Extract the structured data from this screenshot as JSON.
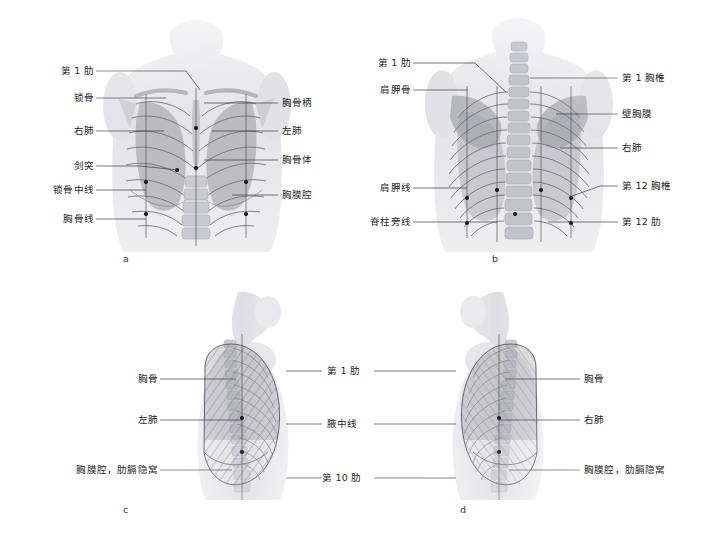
{
  "figure": {
    "background_color": "#ffffff",
    "line_color": "#3d3d3d",
    "text_color": "#1f1f1f"
  },
  "panels": [
    {
      "id": "a",
      "letter": "a",
      "view": "anterior-view",
      "labels_left": [
        {
          "text": "第 1 肋",
          "name": "label-first-rib"
        },
        {
          "text": "锁骨",
          "name": "label-clavicle"
        },
        {
          "text": "右肺",
          "name": "label-right-lung"
        },
        {
          "text": "剑突",
          "name": "label-xiphoid-process"
        },
        {
          "text": "锁骨中线",
          "name": "label-midclavicular-line"
        },
        {
          "text": "胸骨线",
          "name": "label-sternal-line"
        }
      ],
      "labels_right": [
        {
          "text": "胸骨柄",
          "name": "label-manubrium"
        },
        {
          "text": "左肺",
          "name": "label-left-lung"
        },
        {
          "text": "胸骨体",
          "name": "label-sternal-body"
        },
        {
          "text": "胸膜腔",
          "name": "label-pleural-cavity"
        }
      ]
    },
    {
      "id": "b",
      "letter": "b",
      "view": "posterior-view",
      "labels_left": [
        {
          "text": "第 1 肋",
          "name": "label-first-rib"
        },
        {
          "text": "肩胛骨",
          "name": "label-scapula"
        },
        {
          "text": "肩胛线",
          "name": "label-scapular-line"
        },
        {
          "text": "脊柱旁线",
          "name": "label-paravertebral-line"
        }
      ],
      "labels_right": [
        {
          "text": "第 1 胸椎",
          "name": "label-first-thoracic-vertebra"
        },
        {
          "text": "壁胸膜",
          "name": "label-parietal-pleura"
        },
        {
          "text": "右肺",
          "name": "label-right-lung"
        },
        {
          "text": "第 12 胸椎",
          "name": "label-twelfth-thoracic-vertebra"
        },
        {
          "text": "第 12 肋",
          "name": "label-twelfth-rib"
        }
      ]
    },
    {
      "id": "c",
      "letter": "c",
      "view": "left-lateral-view",
      "labels_left": [
        {
          "text": "胸骨",
          "name": "label-sternum"
        },
        {
          "text": "左肺",
          "name": "label-left-lung"
        },
        {
          "text": "胸膜腔，肋膈隐窝",
          "name": "label-pleural-cavity-costodiaphragmatic-recess"
        }
      ],
      "labels_right": []
    },
    {
      "id": "d",
      "letter": "d",
      "view": "right-lateral-view",
      "labels_left": [],
      "labels_right": [
        {
          "text": "胸骨",
          "name": "label-sternum"
        },
        {
          "text": "右肺",
          "name": "label-right-lung"
        },
        {
          "text": "胸膜腔，肋膈隐窝",
          "name": "label-pleural-cavity-costodiaphragmatic-recess"
        }
      ]
    }
  ],
  "center_labels": [
    {
      "text": "第 1 肋",
      "name": "label-first-rib-center"
    },
    {
      "text": "腋中线",
      "name": "label-midaxillary-line"
    },
    {
      "text": "第 10 肋",
      "name": "label-tenth-rib"
    }
  ]
}
